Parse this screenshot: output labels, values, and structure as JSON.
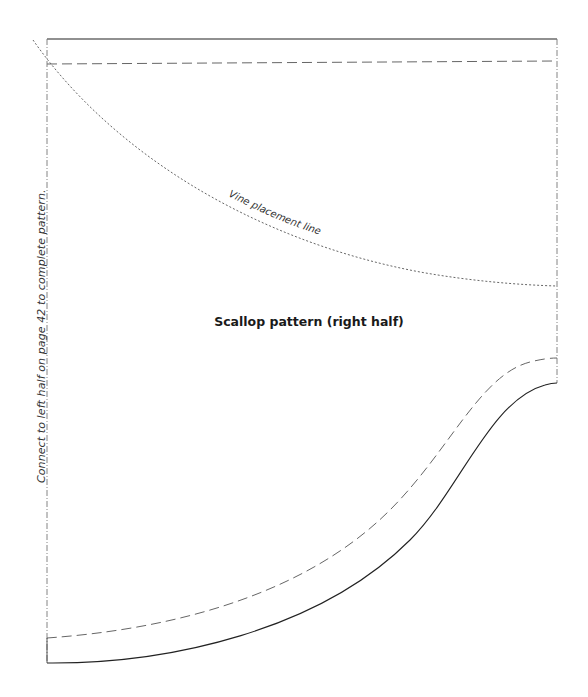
{
  "pattern": {
    "title": "Scallop pattern (right half)",
    "vine_label": "Vine placement line",
    "side_note": "Connect to left half on page 42 to complete pattern.",
    "colors": {
      "solid_line": "#222222",
      "dashed_line": "#666666",
      "dotted_line": "#555555",
      "fold_line": "#777777",
      "text": "#1a1a1a"
    },
    "lines": {
      "top_edge": {
        "style": "solid",
        "from": [
          47,
          39
        ],
        "to": [
          557,
          39
        ]
      },
      "top_seam": {
        "style": "dashed",
        "from": [
          47,
          64
        ],
        "to": [
          557,
          61
        ]
      },
      "left_fold": {
        "style": "dash-dot",
        "from": [
          47,
          39
        ],
        "to": [
          47,
          663
        ]
      },
      "right_edge": {
        "style": "dash-dot",
        "from": [
          557,
          39
        ],
        "to": [
          557,
          383
        ]
      },
      "vine_line": {
        "style": "dotted",
        "from": [
          33,
          40
        ],
        "to": [
          557,
          286
        ]
      },
      "scallop_edge": {
        "style": "solid",
        "from": [
          47,
          663
        ],
        "to": [
          557,
          383
        ]
      },
      "scallop_seam": {
        "style": "dashed",
        "from": [
          47,
          638
        ],
        "to": [
          557,
          358
        ]
      }
    }
  }
}
